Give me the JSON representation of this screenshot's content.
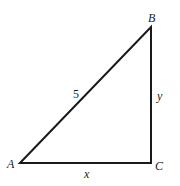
{
  "diagram": {
    "type": "right-triangle",
    "vertices": {
      "A": {
        "label": "A"
      },
      "B": {
        "label": "B"
      },
      "C": {
        "label": "C"
      }
    },
    "sides": {
      "hypotenuse_AB": {
        "label": "5"
      },
      "base_AC": {
        "label": "x"
      },
      "height_BC": {
        "label": "y"
      }
    },
    "right_angle_at": "C",
    "stroke_color": "#1a1a1a"
  }
}
